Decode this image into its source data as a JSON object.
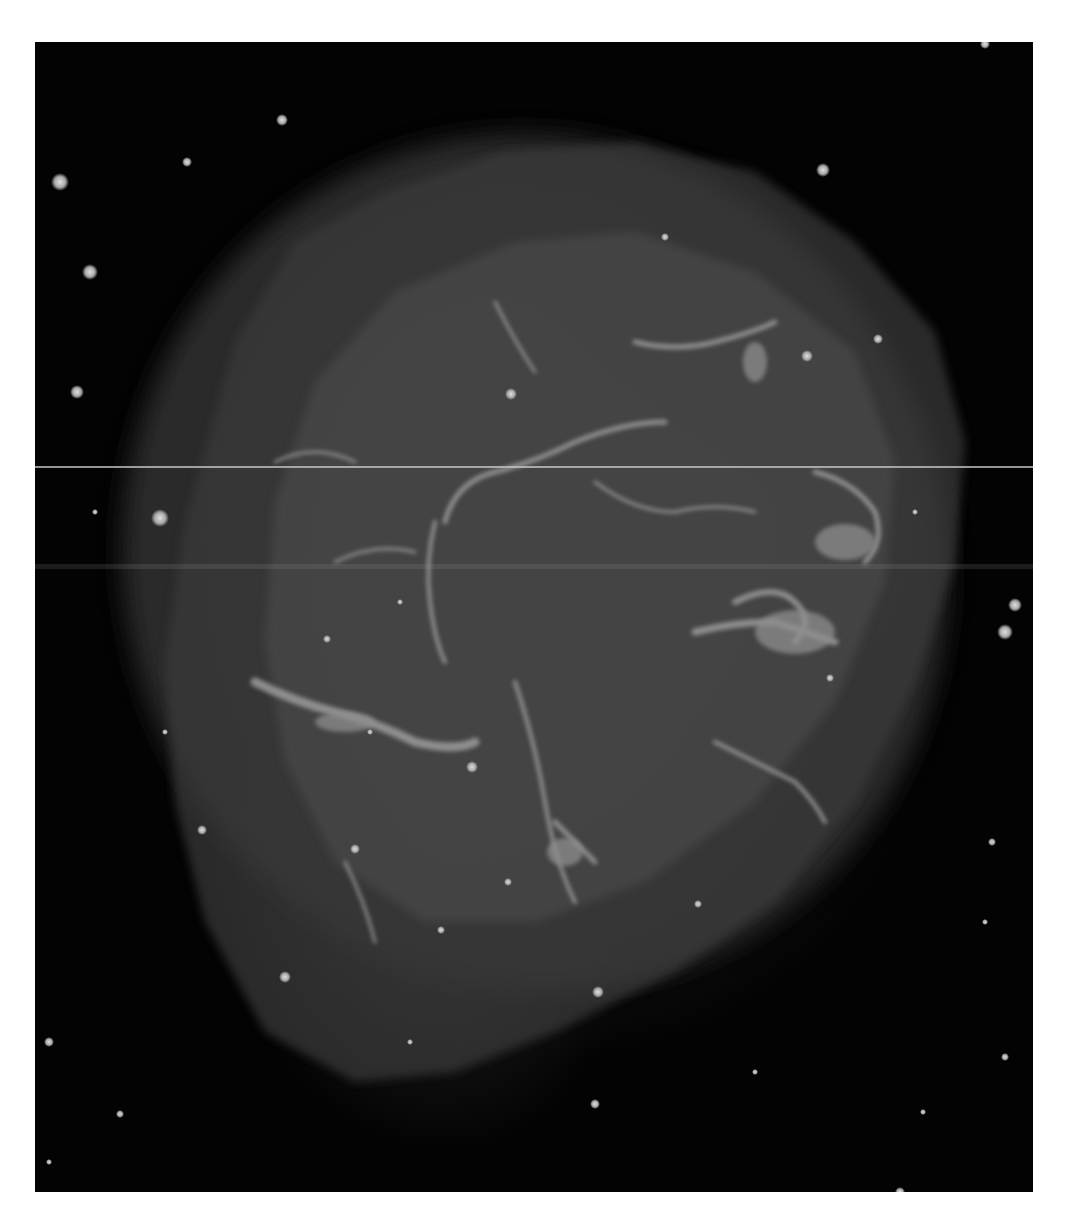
{
  "image": {
    "subject": "Crab Nebula",
    "description": "Grayscale astronomical photograph of a supernova remnant nebula with bright filamentary structure surrounded by a dark star field",
    "colors": {
      "background_page": "#ffffff",
      "sky": "#030303",
      "nebula_core": "#5c5c5c",
      "filament": "#a0a0a0",
      "star": "#c8c8c8"
    }
  }
}
